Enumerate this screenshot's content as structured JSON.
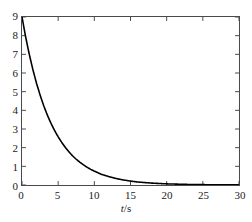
{
  "chart_data": {
    "type": "line",
    "title": "",
    "subtitle": "",
    "xlabel": "t/s",
    "xlabel_variable": "t",
    "xlabel_rest": "/s",
    "ylabel": "",
    "xlim": [
      0,
      30
    ],
    "ylim": [
      0,
      9
    ],
    "xticks": [
      0,
      5,
      10,
      15,
      20,
      25,
      30
    ],
    "xtick_labels": [
      "0",
      "5",
      "10",
      "15",
      "20",
      "25",
      "30"
    ],
    "yticks": [
      0,
      1,
      2,
      3,
      4,
      5,
      6,
      7,
      8,
      9
    ],
    "ytick_labels": [
      "0",
      "1",
      "2",
      "3",
      "4",
      "5",
      "6",
      "7",
      "8",
      "9"
    ],
    "grid": false,
    "legend": null,
    "legend_position": "none",
    "line_color": "#000000",
    "axis_color": "#4a4a4a",
    "series": [
      {
        "name": "exponential decay",
        "expression": "9*exp(-t/4)",
        "x": [
          0,
          0.5,
          1,
          1.5,
          2,
          2.5,
          3,
          3.5,
          4,
          4.5,
          5,
          5.5,
          6,
          6.5,
          7,
          7.5,
          8,
          8.5,
          9,
          9.5,
          10,
          11,
          12,
          13,
          14,
          15,
          16,
          17,
          18,
          19,
          20,
          21,
          22,
          23,
          24,
          25,
          26,
          27,
          28,
          29,
          30
        ],
        "values": [
          9.0,
          7.94,
          7.01,
          6.19,
          5.46,
          4.82,
          4.25,
          3.75,
          3.31,
          2.92,
          2.58,
          2.28,
          2.01,
          1.77,
          1.56,
          1.38,
          1.22,
          1.08,
          0.95,
          0.84,
          0.74,
          0.57,
          0.45,
          0.35,
          0.27,
          0.21,
          0.16,
          0.13,
          0.1,
          0.08,
          0.06,
          0.05,
          0.04,
          0.03,
          0.024,
          0.019,
          0.015,
          0.011,
          0.009,
          0.007,
          0.005
        ]
      }
    ]
  },
  "axes": {
    "x_title_variable": "t",
    "x_title_rest": "/s"
  }
}
